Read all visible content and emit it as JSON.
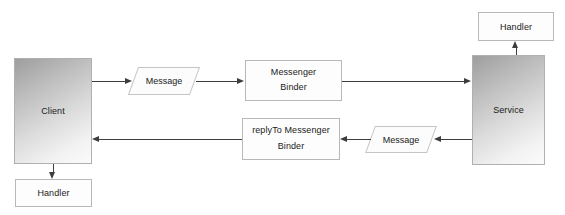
{
  "diagram": {
    "colors": {
      "line": "#3d3d3d",
      "node_border": "#b8b8b8",
      "node_fill": "#fdfdfd",
      "actor_gradient_dark": "#9e9e9e",
      "actor_gradient_light": "#fbfbfb",
      "text": "#1a1a1a"
    },
    "nodes": {
      "client": {
        "label": "Client",
        "shape": "rectangle-gradient"
      },
      "client_handler": {
        "label": "Handler",
        "shape": "rectangle"
      },
      "request_message": {
        "label": "Message",
        "shape": "parallelogram"
      },
      "request_messenger": {
        "line1": "Messenger",
        "line2": "Binder",
        "shape": "rectangle"
      },
      "reply_messenger": {
        "line1": "replyTo  Messenger",
        "line2": "Binder",
        "shape": "rectangle"
      },
      "reply_message": {
        "label": "Message",
        "shape": "parallelogram"
      },
      "service": {
        "label": "Service",
        "shape": "rectangle-gradient"
      },
      "service_handler": {
        "label": "Handler",
        "shape": "rectangle"
      }
    }
  }
}
